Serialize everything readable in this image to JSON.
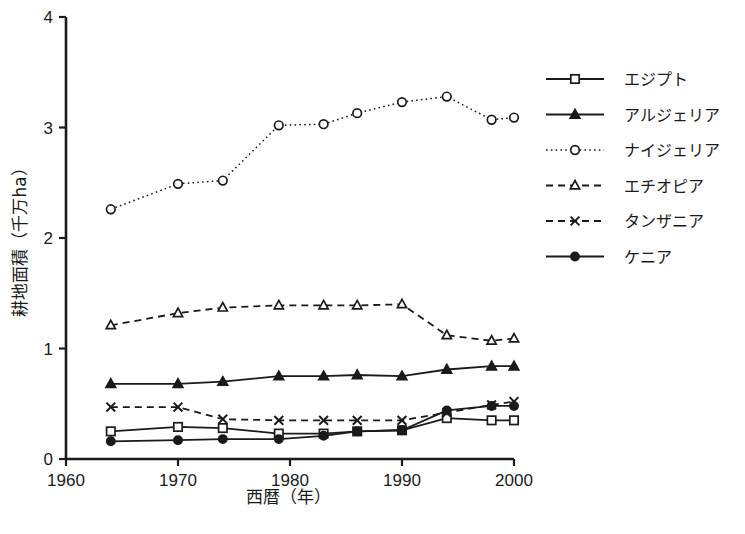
{
  "chart_data": {
    "type": "line",
    "title": "",
    "xlabel": "西暦（年）",
    "ylabel": "耕地面積（千万ha）",
    "x": [
      1964,
      1970,
      1974,
      1979,
      1983,
      1986,
      1990,
      1994,
      1998,
      2000
    ],
    "xlim": [
      1960,
      2000
    ],
    "ylim": [
      0,
      4
    ],
    "xticks": [
      1960,
      1970,
      1980,
      1990,
      2000
    ],
    "xticklabels": [
      "1960",
      "1970",
      "1980",
      "1990",
      "2000"
    ],
    "yticks": [
      0,
      1,
      2,
      3,
      4
    ],
    "yticklabels": [
      "0",
      "1",
      "2",
      "3",
      "4"
    ],
    "grid": false,
    "legend_position": "right",
    "series": [
      {
        "name": "エジプト",
        "marker": "open-square",
        "linestyle": "solid",
        "values": [
          0.25,
          0.29,
          0.28,
          0.23,
          0.23,
          0.25,
          0.26,
          0.37,
          0.35,
          0.35
        ]
      },
      {
        "name": "アルジェリア",
        "marker": "filled-triangle",
        "linestyle": "solid",
        "values": [
          0.68,
          0.68,
          0.7,
          0.75,
          0.75,
          0.76,
          0.75,
          0.81,
          0.84,
          0.84
        ]
      },
      {
        "name": "ナイジェリア",
        "marker": "open-circle",
        "linestyle": "dotted",
        "values": [
          2.26,
          2.49,
          2.52,
          3.02,
          3.03,
          3.13,
          3.23,
          3.28,
          3.07,
          3.09
        ]
      },
      {
        "name": "エチオピア",
        "marker": "open-triangle",
        "linestyle": "dashed",
        "values": [
          1.21,
          1.32,
          1.37,
          1.39,
          1.39,
          1.39,
          1.4,
          1.12,
          1.07,
          1.09
        ]
      },
      {
        "name": "タンザニア",
        "marker": "cross-x",
        "linestyle": "dashed",
        "values": [
          0.47,
          0.47,
          0.36,
          0.35,
          0.35,
          0.35,
          0.35,
          0.42,
          0.49,
          0.52
        ]
      },
      {
        "name": "ケニア",
        "marker": "filled-circle",
        "linestyle": "solid",
        "values": [
          0.16,
          0.17,
          0.18,
          0.18,
          0.21,
          0.25,
          0.26,
          0.44,
          0.48,
          0.48
        ]
      }
    ]
  },
  "legend": {
    "items": [
      {
        "label": "エジプト"
      },
      {
        "label": "アルジェリア"
      },
      {
        "label": "ナイジェリア"
      },
      {
        "label": "エチオピア"
      },
      {
        "label": "タンザニア"
      },
      {
        "label": "ケニア"
      }
    ]
  },
  "colors": {
    "ink": "#1a1a1a",
    "axis": "#111111",
    "background": "#ffffff"
  }
}
